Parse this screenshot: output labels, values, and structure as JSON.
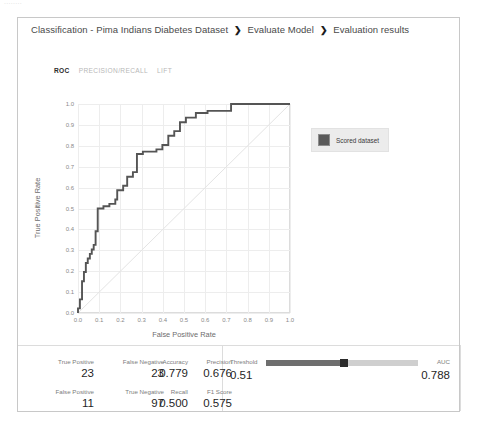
{
  "ghost_text": "........",
  "breadcrumb": {
    "items": [
      "Classification - Pima Indians Diabetes Dataset",
      "Evaluate Model",
      "Evaluation results"
    ],
    "separator": "❯"
  },
  "tabs": [
    {
      "label": "ROC",
      "active": true
    },
    {
      "label": "PRECISION/RECALL",
      "active": false
    },
    {
      "label": "LIFT",
      "active": false
    }
  ],
  "legend": {
    "label": "Scored dataset",
    "color": "#5a5a5a"
  },
  "metrics": {
    "true_positive": {
      "label": "True Positive",
      "value": "23"
    },
    "false_negative": {
      "label": "False Negative",
      "value": "23"
    },
    "false_positive": {
      "label": "False Positive",
      "value": "11"
    },
    "true_negative": {
      "label": "True Negative",
      "value": "97"
    },
    "accuracy": {
      "label": "Accuracy",
      "value": "0.779"
    },
    "precision": {
      "label": "Precision",
      "value": "0.676"
    },
    "recall": {
      "label": "Recall",
      "value": "0.500"
    },
    "f1_score": {
      "label": "F1 Score",
      "value": "0.575"
    },
    "threshold": {
      "label": "Threshold",
      "value": "0.51"
    },
    "auc": {
      "label": "AUC",
      "value": "0.788"
    }
  },
  "chart_data": {
    "type": "line",
    "title": "",
    "xlabel": "False Positive Rate",
    "ylabel": "True Positive Rate",
    "xlim": [
      0.0,
      1.0
    ],
    "ylim": [
      0.0,
      1.0
    ],
    "xticks": [
      "0.0",
      "0.1",
      "0.2",
      "0.3",
      "0.4",
      "0.5",
      "0.6",
      "0.7",
      "0.8",
      "0.9",
      "1.0"
    ],
    "yticks": [
      "0.0",
      "0.1",
      "0.2",
      "0.3",
      "0.4",
      "0.5",
      "0.6",
      "0.7",
      "0.8",
      "0.9",
      "1.0"
    ],
    "grid": true,
    "legend_position": "right",
    "series": [
      {
        "name": "Scored dataset",
        "color": "#555555",
        "step": true,
        "x": [
          0.0,
          0.0,
          0.009,
          0.009,
          0.019,
          0.019,
          0.019,
          0.028,
          0.028,
          0.037,
          0.037,
          0.046,
          0.046,
          0.056,
          0.056,
          0.065,
          0.065,
          0.074,
          0.074,
          0.083,
          0.083,
          0.093,
          0.093,
          0.12,
          0.12,
          0.148,
          0.148,
          0.176,
          0.176,
          0.185,
          0.185,
          0.213,
          0.213,
          0.232,
          0.232,
          0.259,
          0.259,
          0.278,
          0.278,
          0.306,
          0.306,
          0.37,
          0.37,
          0.398,
          0.398,
          0.426,
          0.426,
          0.454,
          0.454,
          0.481,
          0.481,
          0.509,
          0.509,
          0.556,
          0.556,
          0.611,
          0.611,
          0.722,
          0.722,
          0.852,
          0.852,
          1.0
        ],
        "y": [
          0.0,
          0.022,
          0.022,
          0.065,
          0.065,
          0.109,
          0.152,
          0.152,
          0.196,
          0.196,
          0.239,
          0.239,
          0.261,
          0.261,
          0.283,
          0.283,
          0.304,
          0.304,
          0.326,
          0.326,
          0.391,
          0.391,
          0.5,
          0.5,
          0.511,
          0.511,
          0.522,
          0.522,
          0.543,
          0.543,
          0.587,
          0.587,
          0.609,
          0.609,
          0.652,
          0.652,
          0.674,
          0.674,
          0.761,
          0.761,
          0.772,
          0.772,
          0.783,
          0.783,
          0.804,
          0.804,
          0.848,
          0.848,
          0.87,
          0.87,
          0.913,
          0.913,
          0.935,
          0.935,
          0.957,
          0.957,
          0.967,
          0.967,
          1.0,
          1.0,
          1.0,
          1.0
        ]
      },
      {
        "name": "random-baseline",
        "color": "#e4e4e4",
        "step": false,
        "x": [
          0.0,
          1.0
        ],
        "y": [
          0.0,
          1.0
        ]
      }
    ]
  }
}
